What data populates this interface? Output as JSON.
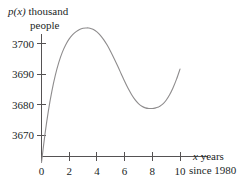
{
  "chart_data": {
    "type": "line",
    "title": "",
    "ylabel_line1_var": "p(x)",
    "ylabel_line1_rest": " thousand",
    "ylabel_line2": "people",
    "xlabel_var": "x",
    "xlabel_rest": " years",
    "xlabel_line2": "since 1980",
    "xlabel_full": "x years since 1980",
    "ylabel_full": "p(x) thousand people",
    "xlabel": "x years since 1980",
    "ylabel": "p(x) thousand people",
    "x_ticks": [
      0,
      2,
      4,
      6,
      8,
      10
    ],
    "x_tick_labels": [
      "0",
      "2",
      "4",
      "6",
      "8",
      "10"
    ],
    "y_ticks": [
      3670,
      3680,
      3690,
      3700
    ],
    "y_tick_labels": [
      "3670",
      "3680",
      "3690",
      "3700"
    ],
    "xlim": [
      0,
      10.3
    ],
    "ylim": [
      3661,
      3709
    ],
    "grid": false,
    "legend": null,
    "curve_color": "#8e8c8d",
    "axis_color": "#555253",
    "text_color": "#221f1f",
    "series": [
      {
        "name": "p(x)",
        "x": [
          0.0,
          0.25,
          0.5,
          0.75,
          1.0,
          1.25,
          1.5,
          1.75,
          2.0,
          2.25,
          2.5,
          2.75,
          3.0,
          3.25,
          3.4,
          3.5,
          3.75,
          4.0,
          4.25,
          4.5,
          4.75,
          5.0,
          5.25,
          5.5,
          5.75,
          6.0,
          6.25,
          6.5,
          6.75,
          7.0,
          7.25,
          7.5,
          7.75,
          8.0,
          8.25,
          8.4,
          8.5,
          8.75,
          9.0,
          9.25,
          9.5,
          9.75,
          10.0
        ],
        "y": [
          3661.0,
          3670.2,
          3678.0,
          3684.4,
          3689.6,
          3693.8,
          3697.1,
          3699.6,
          3701.5,
          3702.9,
          3703.9,
          3704.6,
          3705.0,
          3705.1,
          3705.1,
          3705.0,
          3704.6,
          3703.8,
          3702.7,
          3701.2,
          3699.4,
          3697.3,
          3695.0,
          3692.6,
          3690.1,
          3687.6,
          3685.3,
          3683.3,
          3681.6,
          3680.3,
          3679.4,
          3678.9,
          3678.7,
          3678.7,
          3678.9,
          3679.1,
          3679.3,
          3680.1,
          3681.4,
          3683.2,
          3685.5,
          3688.3,
          3691.6
        ]
      }
    ],
    "annotations": {
      "local_max": {
        "x": 3.4,
        "y": 3705.1
      },
      "local_min": {
        "x": 8.2,
        "y": 3678.7
      },
      "endpoint": {
        "x": 10.0,
        "y": 3691.6
      }
    }
  }
}
